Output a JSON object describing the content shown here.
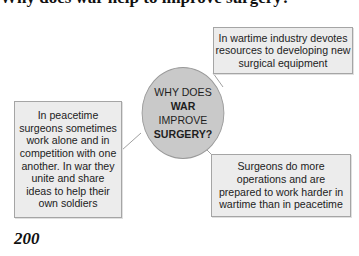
{
  "header": {
    "title": "Why does war help to improve surgery?"
  },
  "center": {
    "line1": "WHY DOES",
    "line2": "WAR",
    "line3": "IMPROVE",
    "line4": "SURGERY?"
  },
  "boxes": [
    {
      "position": "top-right",
      "text": "In wartime industry devotes resources to developing new surgical equipment"
    },
    {
      "position": "left",
      "text": "In peacetime surgeons sometimes work alone and in competition with one another. In war they unite and share ideas to help their own soldiers"
    },
    {
      "position": "bottom-right",
      "text": "Surgeons do more operations and are prepared to work harder in wartime than in peacetime"
    }
  ],
  "footer": {
    "page_number": "200"
  },
  "colors": {
    "circle_fill": "#c9c9c9",
    "box_fill": "#ececec",
    "border": "#a5a5a5",
    "connector": "#a0a0a0"
  }
}
